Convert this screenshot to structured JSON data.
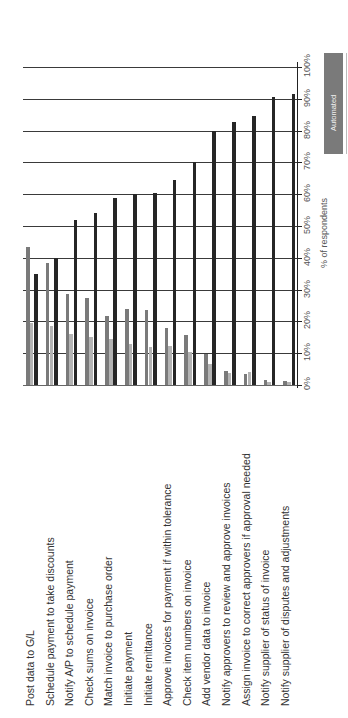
{
  "chart_data": {
    "type": "bar",
    "orientation": "rotated-90-ccw (page printed sideways; categories read bottom-to-top as text, values increase upward)",
    "title": "",
    "xlabel": "",
    "ylabel": "% of respondents",
    "ylim": [
      0,
      100
    ],
    "yticks": [
      "0%",
      "10%",
      "20%",
      "30%",
      "40%",
      "50%",
      "60%",
      "70%",
      "80%",
      "90%",
      "100%"
    ],
    "grid": true,
    "legend_position": "right (partially cut off)",
    "legend": [
      {
        "label": "Automated",
        "color": "#7a7a7a"
      }
    ],
    "categories": [
      "Post data to G/L",
      "Schedule payment to take discounts",
      "Notify A/P to schedule payment",
      "Check sums on invoice",
      "Match invoice to purchase order",
      "Initiate payment",
      "Initiate remittance",
      "Approve invoices for payment if within tolerance",
      "Check item numbers on invoice",
      "Add vendor data to invoice",
      "Notify approvers to review and approve invoices",
      "Assign invoice to correct approvers if approval needed",
      "Notify supplier of status of invoice",
      "Notify supplier of disputes and adjustments"
    ],
    "series": [
      {
        "name": "Automated",
        "color": "#7a7a7a",
        "values": [
          43.5,
          38.5,
          28.7,
          27.4,
          21.8,
          24.0,
          23.7,
          18.0,
          15.8,
          9.8,
          4.4,
          3.5,
          1.6,
          1.3
        ]
      },
      {
        "name": "",
        "color": "#b4b4b4",
        "values": [
          19.5,
          18.6,
          16.0,
          15.0,
          14.5,
          13.0,
          12.0,
          12.3,
          10.4,
          6.6,
          3.8,
          4.0,
          0.8,
          0.8
        ]
      },
      {
        "name": "",
        "color": "#262626",
        "values": [
          35.0,
          40.0,
          52.0,
          54.0,
          58.7,
          60.0,
          60.3,
          64.5,
          70.0,
          80.0,
          82.7,
          84.5,
          90.5,
          91.5
        ]
      }
    ]
  }
}
